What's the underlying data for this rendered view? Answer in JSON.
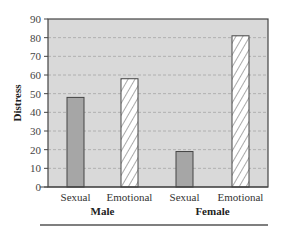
{
  "chart_data": {
    "type": "bar",
    "title": "",
    "xlabel": "",
    "ylabel": "Distress",
    "ylim": [
      0,
      90
    ],
    "yticks": [
      0,
      10,
      20,
      30,
      40,
      50,
      60,
      70,
      80,
      90
    ],
    "grid": true,
    "legend": null,
    "groups": [
      "Male",
      "Female"
    ],
    "categories": [
      "Sexual",
      "Emotional",
      "Sexual",
      "Emotional"
    ],
    "series": [
      {
        "name": "Male",
        "values": {
          "Sexual": 48,
          "Emotional": 58
        }
      },
      {
        "name": "Female",
        "values": {
          "Sexual": 19,
          "Emotional": 81
        }
      }
    ],
    "bars": [
      {
        "group": "Male",
        "category": "Sexual",
        "value": 48,
        "fill": "solid-gray"
      },
      {
        "group": "Male",
        "category": "Emotional",
        "value": 58,
        "fill": "hatched"
      },
      {
        "group": "Female",
        "category": "Sexual",
        "value": 19,
        "fill": "solid-gray"
      },
      {
        "group": "Female",
        "category": "Emotional",
        "value": 81,
        "fill": "hatched"
      }
    ],
    "colors": {
      "plot_background": "#d9d9d9",
      "solid_bar": "#a6a6a6",
      "hatched_bar_bg": "#ffffff",
      "hatch_line": "#555555",
      "gridline": "#b0b0b0",
      "axis": "#444444"
    }
  }
}
